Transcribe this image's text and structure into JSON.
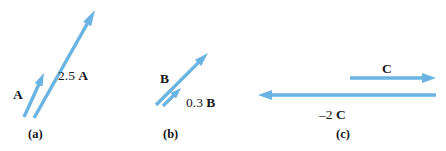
{
  "figure": {
    "background": "#ffffff",
    "arrow_color": "#6ab4e4",
    "text_color": "#17171a",
    "panels": [
      {
        "id": "a",
        "caption": "(a)",
        "caption_x": 28,
        "caption_y": 128,
        "vectors": [
          {
            "name": "A",
            "label": "A",
            "label_x": 13,
            "label_y": 88,
            "x1": 24,
            "y1": 117,
            "x2": 44,
            "y2": 73,
            "width": 3.4,
            "head_len": 13,
            "head_half_w": 4.2
          },
          {
            "name": "2.5 A",
            "label": "2.5 A",
            "label_x": 58,
            "label_y": 69,
            "x1": 34,
            "y1": 118,
            "x2": 95,
            "y2": 10,
            "width": 3.4,
            "head_len": 16,
            "head_half_w": 4.6
          }
        ]
      },
      {
        "id": "b",
        "caption": "(b)",
        "caption_x": 163,
        "caption_y": 128,
        "vectors": [
          {
            "name": "B",
            "label": "B",
            "label_x": 160,
            "label_y": 72,
            "x1": 156,
            "y1": 105,
            "x2": 208,
            "y2": 53,
            "width": 3.4,
            "head_len": 14,
            "head_half_w": 4.4
          },
          {
            "name": "0.3 B",
            "label": "0.3 B",
            "label_x": 186,
            "label_y": 96,
            "x1": 163,
            "y1": 106,
            "x2": 181,
            "y2": 88,
            "width": 3.4,
            "head_len": 11,
            "head_half_w": 4.0
          }
        ]
      },
      {
        "id": "c",
        "caption": "(c)",
        "caption_x": 336,
        "caption_y": 128,
        "vectors": [
          {
            "name": "C",
            "label": "C",
            "label_x": 382,
            "label_y": 62,
            "x1": 350,
            "y1": 78,
            "x2": 436,
            "y2": 78,
            "width": 3.6,
            "head_len": 14,
            "head_half_w": 5.0
          },
          {
            "name": "-2 C",
            "label": "–2 C",
            "label_x": 319,
            "label_y": 108,
            "x1": 436,
            "y1": 95,
            "x2": 258,
            "y2": 95,
            "width": 3.6,
            "head_len": 14,
            "head_half_w": 5.0
          }
        ]
      }
    ]
  }
}
